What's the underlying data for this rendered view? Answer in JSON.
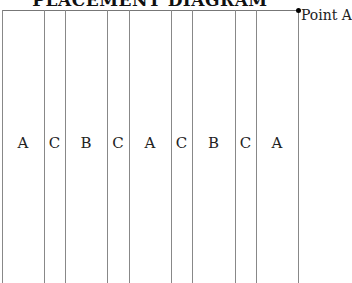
{
  "diagram": {
    "title": "PLACEMENT DIAGRAM",
    "point_label": "Point A",
    "columns": [
      {
        "label": "A",
        "x0": 2,
        "x1": 44
      },
      {
        "label": "C",
        "x0": 44,
        "x1": 65
      },
      {
        "label": "B",
        "x0": 65,
        "x1": 107
      },
      {
        "label": "C",
        "x0": 107,
        "x1": 129
      },
      {
        "label": "A",
        "x0": 129,
        "x1": 171
      },
      {
        "label": "C",
        "x0": 171,
        "x1": 192
      },
      {
        "label": "B",
        "x0": 192,
        "x1": 235
      },
      {
        "label": "C",
        "x0": 235,
        "x1": 256
      },
      {
        "label": "A",
        "x0": 256,
        "x1": 298
      }
    ]
  }
}
